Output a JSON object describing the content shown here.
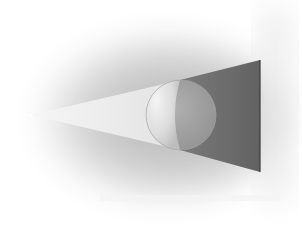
{
  "diagram": {
    "title": "",
    "elements": {
      "light_source": {
        "label": "",
        "x": 31,
        "y": 115
      },
      "sphere": {
        "label": "",
        "cx": 181,
        "cy": 115,
        "r": 35
      },
      "wall": {
        "label": "",
        "x": 260
      },
      "shadow": {
        "label": "",
        "top_y": 60,
        "bottom_y": 172
      }
    },
    "colors": {
      "background": "#ffffff",
      "haze": "#bdbdbd",
      "beam": "#ececec",
      "shadow": "#6a6a6a",
      "wall_edge": "#3a3a3a",
      "sphere_lit": "#e6e6e6",
      "sphere_dark": "#9a9a9a"
    }
  }
}
